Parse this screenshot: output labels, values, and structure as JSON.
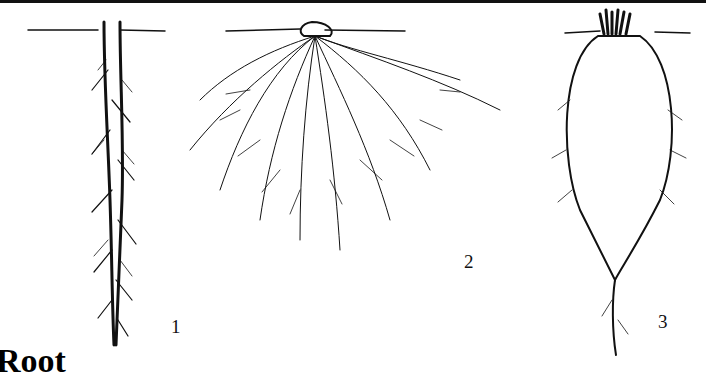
{
  "figure": {
    "heading": "Root",
    "panels": [
      {
        "id": 1,
        "label": "1",
        "type": "taproot"
      },
      {
        "id": 2,
        "label": "2",
        "type": "fibrous root"
      },
      {
        "id": 3,
        "label": "3",
        "type": "storage root"
      }
    ]
  }
}
